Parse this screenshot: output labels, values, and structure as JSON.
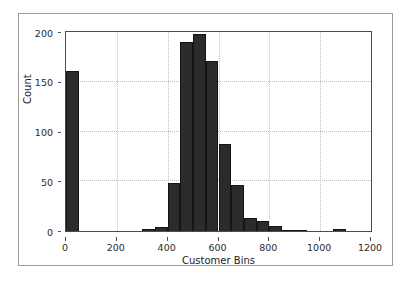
{
  "figure": {
    "background_color": "#ffffff",
    "frame_color": "#9a9a9a",
    "axes_edge_color": "#4d4d4d",
    "grid_color": "#c2c2c2",
    "bar_color": "#2b2b2b"
  },
  "chart_data": {
    "type": "bar",
    "title": "",
    "subtitle": "",
    "xlabel": "Customer Bins",
    "ylabel": "Count",
    "xlim": [
      0,
      1200
    ],
    "ylim": [
      0,
      200
    ],
    "xticks": [
      0,
      200,
      400,
      600,
      800,
      1000,
      1200
    ],
    "xtick_labels": [
      "0",
      "200",
      "400",
      "600",
      "800",
      "1000",
      "1200"
    ],
    "yticks": [
      0,
      50,
      100,
      150,
      200
    ],
    "ytick_labels": [
      "0",
      "50",
      "100",
      "150",
      "200"
    ],
    "grid": true,
    "grid_style": "dotted",
    "legend": null,
    "legend_position": "none",
    "bin_width": 50,
    "bin_edges": [
      0,
      50,
      100,
      150,
      200,
      250,
      300,
      350,
      400,
      450,
      500,
      550,
      600,
      650,
      700,
      750,
      800,
      850,
      900,
      950,
      1000,
      1050,
      1100,
      1150,
      1200
    ],
    "categories": [
      "0-50",
      "50-100",
      "100-150",
      "150-200",
      "200-250",
      "250-300",
      "300-350",
      "350-400",
      "400-450",
      "450-500",
      "500-550",
      "550-600",
      "600-650",
      "650-700",
      "700-750",
      "750-800",
      "800-850",
      "850-900",
      "900-950",
      "950-1000",
      "1000-1050",
      "1050-1100",
      "1100-1150",
      "1150-1200"
    ],
    "values": [
      161,
      0,
      0,
      0,
      0,
      0,
      2,
      4,
      48,
      190,
      198,
      171,
      87,
      46,
      13,
      10,
      5,
      1,
      1,
      0,
      0,
      2,
      0,
      0
    ]
  }
}
